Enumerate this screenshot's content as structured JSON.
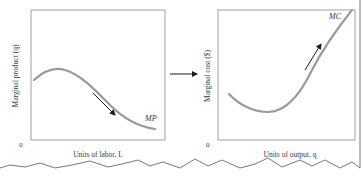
{
  "left_panel": {
    "y_axis_label": "Marginal product (q)",
    "x_axis_label": "Units of labor, L",
    "origin_label": "0",
    "curve_label": "MP",
    "trend": "decreasing"
  },
  "connector": {
    "direction": "right"
  },
  "right_panel": {
    "y_axis_label": "Marginal cost ($)",
    "x_axis_label": "Units of output, q",
    "origin_label": "0",
    "curve_label": "MC",
    "trend": "increasing"
  },
  "colors": {
    "curve": "#9a9a9a",
    "frame": "#8a8a8a",
    "arrow": "#1a1a1a",
    "text": "#3a3a3a",
    "background": "#ffffff"
  }
}
